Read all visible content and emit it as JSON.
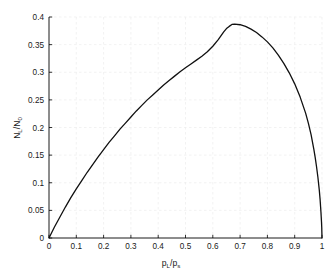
{
  "page": {
    "background_color": "#ffffff",
    "faint_header_text": "",
    "figure_name": "langmuir-adsorption-isotherm-plot"
  },
  "chart_data": {
    "type": "line",
    "title": "",
    "subtitle": "",
    "xlabel": "p_L/p_s",
    "xlabel_parts": {
      "base1": "p",
      "sub1": "L",
      "slash": "/",
      "base2": "p",
      "sub2": "s"
    },
    "ylabel": "N_L/N_0",
    "ylabel_parts": {
      "base1": "N",
      "sub1": "L",
      "slash": "/",
      "base2": "N",
      "sub2": "0"
    },
    "xlim": [
      0,
      1
    ],
    "ylim": [
      0,
      0.4
    ],
    "xticks": [
      0,
      0.1,
      0.2,
      0.3,
      0.4,
      0.5,
      0.6,
      0.7,
      0.8,
      0.9,
      1
    ],
    "xtick_labels": [
      "0",
      "0.1",
      "0.2",
      "0.3",
      "0.4",
      "0.5",
      "0.6",
      "0.7",
      "0.8",
      "0.9",
      "1"
    ],
    "yticks": [
      0,
      0.05,
      0.1,
      0.15,
      0.2,
      0.25,
      0.3,
      0.35,
      0.4
    ],
    "ytick_labels": [
      "0",
      "0.05",
      "0.1",
      "0.15",
      "0.2",
      "0.25",
      "0.3",
      "0.35",
      "0.4"
    ],
    "grid": true,
    "grid_style": "dashed",
    "grid_color": "#ededed",
    "axis_color": "#000000",
    "legend": null,
    "legend_position": "none",
    "series": [
      {
        "name": "N_L/N_0",
        "color": "#101010",
        "line_width": 1.3,
        "x": [
          0.0,
          0.01,
          0.02,
          0.03,
          0.04,
          0.05,
          0.06,
          0.08,
          0.1,
          0.12,
          0.14,
          0.16,
          0.18,
          0.2,
          0.22,
          0.24,
          0.26,
          0.28,
          0.3,
          0.32,
          0.34,
          0.36,
          0.38,
          0.4,
          0.42,
          0.44,
          0.46,
          0.48,
          0.5,
          0.52,
          0.54,
          0.56,
          0.58,
          0.6,
          0.62,
          0.64,
          0.65,
          0.66,
          0.67,
          0.68,
          0.7,
          0.72,
          0.74,
          0.76,
          0.78,
          0.8,
          0.82,
          0.84,
          0.86,
          0.88,
          0.9,
          0.92,
          0.94,
          0.95,
          0.96,
          0.97,
          0.975,
          0.98,
          0.985,
          0.99,
          0.993,
          0.996,
          0.998,
          0.999,
          1.0
        ],
        "y": [
          0.0,
          0.01,
          0.02,
          0.029,
          0.038,
          0.047,
          0.056,
          0.073,
          0.089,
          0.104,
          0.119,
          0.133,
          0.147,
          0.16,
          0.173,
          0.185,
          0.197,
          0.208,
          0.219,
          0.23,
          0.24,
          0.25,
          0.259,
          0.268,
          0.277,
          0.285,
          0.293,
          0.301,
          0.308,
          0.315,
          0.322,
          0.329,
          0.337,
          0.347,
          0.359,
          0.373,
          0.379,
          0.383,
          0.3865,
          0.387,
          0.386,
          0.383,
          0.378,
          0.372,
          0.364,
          0.355,
          0.344,
          0.331,
          0.316,
          0.299,
          0.279,
          0.255,
          0.226,
          0.208,
          0.187,
          0.161,
          0.146,
          0.129,
          0.11,
          0.087,
          0.07,
          0.048,
          0.031,
          0.02,
          0.0
        ]
      }
    ],
    "annotations": [],
    "peak": {
      "x": 0.675,
      "y": 0.387
    }
  }
}
